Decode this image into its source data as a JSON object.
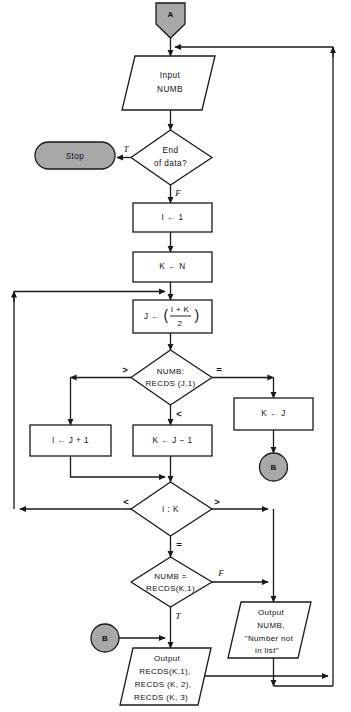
{
  "diagram": {
    "colors": {
      "connector_fill": "#a8a8a8",
      "terminal_fill": "#a8a8a8",
      "shape_fill": "#ffffff",
      "line": "#1a1a1a",
      "text": "#111111"
    }
  },
  "nodes": {
    "connector_a": {
      "label": "A",
      "shape": "pentagon-connector"
    },
    "input_numb": {
      "line1": "Input",
      "line2": "NUMB",
      "shape": "parallelogram"
    },
    "end_of_data": {
      "line1": "End",
      "line2": "of data?",
      "shape": "diamond"
    },
    "stop": {
      "label": "Stop",
      "shape": "terminal-oval"
    },
    "set_i_1": {
      "label": "I ← 1",
      "shape": "process"
    },
    "set_k_n": {
      "label": "K ← N",
      "shape": "process"
    },
    "compute_j": {
      "lhs": "J ←",
      "paren_open": "(",
      "numerator": "I + K",
      "denominator": "2",
      "paren_close": ")",
      "shape": "process"
    },
    "compare_numb_recds_j": {
      "line1": "NUMB:",
      "line2": "RECDS (J,1)",
      "shape": "diamond"
    },
    "set_i_j_plus_1": {
      "label": "I ← J + 1",
      "shape": "process"
    },
    "set_k_j_minus_1": {
      "label": "K ← J − 1",
      "shape": "process"
    },
    "set_k_j": {
      "label": "K ← J",
      "shape": "process"
    },
    "connector_b_top": {
      "label": "B",
      "shape": "circle-connector"
    },
    "compare_i_k": {
      "label": "I : K",
      "shape": "diamond"
    },
    "compare_numb_recds_k": {
      "line1": "NUMB =",
      "line2": "RECDS(K,1)",
      "shape": "diamond"
    },
    "connector_b_bottom": {
      "label": "B",
      "shape": "circle-connector"
    },
    "output_not_found": {
      "line1": "Output",
      "line2": "NUMB,",
      "line3": "\"Number not",
      "line4": "in list\"",
      "shape": "parallelogram"
    },
    "output_record": {
      "line1": "Output",
      "line2": "RECDS(K,1),",
      "line3": "RECDS (K, 2),",
      "line4": "RECDS (K, 3)",
      "shape": "parallelogram"
    }
  },
  "edge_labels": {
    "end_of_data_true": "T",
    "end_of_data_false": "F",
    "compare_j_greater": ">",
    "compare_j_equal": "=",
    "compare_j_less": "<",
    "compare_ik_less": "<",
    "compare_ik_greater": ">",
    "compare_ik_equal": "=",
    "numb_eq_false": "F",
    "numb_eq_true": "T"
  }
}
